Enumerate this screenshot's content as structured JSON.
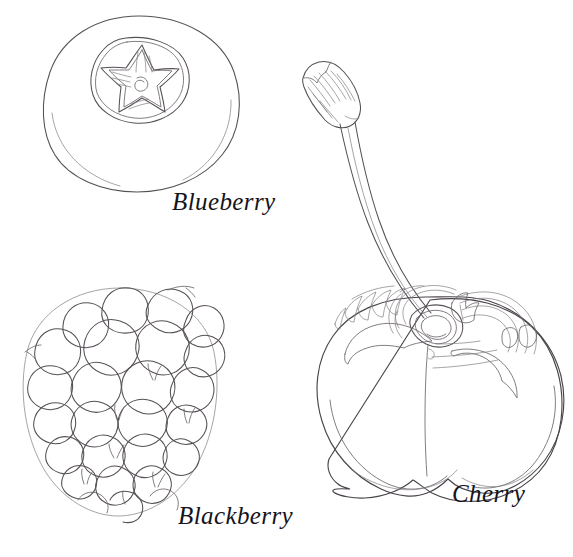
{
  "page": {
    "background_color": "#ffffff",
    "width": 573,
    "height": 557,
    "ink_color": "#555055",
    "label_color": "#16141a",
    "style": "hand-drawn botanical line art, uncolored outline"
  },
  "figures": [
    {
      "id": "blueberry",
      "label": "Blueberry",
      "description": "Round blueberry viewed from the top showing the five-pointed calyx star crown in the center",
      "label_position": {
        "x": 172,
        "y": 189
      },
      "bounds": {
        "x": 42,
        "y": 14,
        "width": 196,
        "height": 180
      }
    },
    {
      "id": "blackberry",
      "label": "Blackberry",
      "description": "Cluster of rounded drupelets forming an oval blackberry with fine hair whiskers",
      "label_position": {
        "x": 178,
        "y": 503
      },
      "bounds": {
        "x": 18,
        "y": 285,
        "width": 205,
        "height": 235
      }
    },
    {
      "id": "cherry",
      "label": "Cherry",
      "description": "Single cherry with a long curved stem and ridged stem tip, heart-shaped body with highlight strokes and a central crease",
      "label_position": {
        "x": 452,
        "y": 481
      },
      "bounds": {
        "x": 300,
        "y": 60,
        "width": 265,
        "height": 450
      }
    }
  ],
  "labels": {
    "blueberry": "Blueberry",
    "blackberry": "Blackberry",
    "cherry": "Cherry"
  }
}
